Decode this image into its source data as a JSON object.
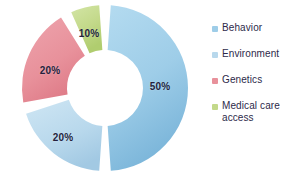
{
  "background": "#ffffff",
  "text_color": "#2d2a4a",
  "label_color": "#241f3d",
  "chart_data": {
    "type": "pie",
    "variant": "donut",
    "title": "",
    "subtitle": "",
    "xlabel": "",
    "ylabel": "",
    "legend_position": "right",
    "grid": false,
    "units": "%",
    "total": 100,
    "categories": [
      "Behavior",
      "Environment",
      "Genetics",
      "Medical care access"
    ],
    "values": [
      50,
      20,
      20,
      10
    ],
    "colors": [
      "#9ecde8",
      "#b8d8ec",
      "#e8919b",
      "#c3d98a"
    ],
    "data_labels": [
      "50%",
      "20%",
      "20%",
      "10%"
    ],
    "slices": [
      {
        "name": "Behavior",
        "value": 50,
        "label": "50%",
        "color": "#9ecde8",
        "color_end": "#7fb9dc",
        "start_angle": 4,
        "end_angle": 176,
        "label_x": 160,
        "label_y": 86
      },
      {
        "name": "Environment",
        "value": 20,
        "label": "20%",
        "color": "#c3dcee",
        "color_end": "#a8cde6",
        "start_angle": 184,
        "end_angle": 252,
        "label_x": 63,
        "label_y": 137
      },
      {
        "name": "Genetics",
        "value": 20,
        "label": "20%",
        "color": "#e8919b",
        "color_end": "#de7b88",
        "start_angle": 260,
        "end_angle": 328,
        "label_x": 50,
        "label_y": 70
      },
      {
        "name": "Medical care access",
        "value": 10,
        "label": "10%",
        "color": "#c9dd91",
        "color_end": "#b4d071",
        "start_angle": 336,
        "end_angle": 356,
        "label_x": 89,
        "label_y": 33
      }
    ],
    "geometry": {
      "center_x": 105,
      "center_y": 88,
      "outer_radius": 83,
      "inner_radius": 38
    }
  },
  "legend": {
    "items": [
      {
        "label": "Behavior",
        "color": "#9ecde8",
        "swatch_icon": "legend-swatch-icon"
      },
      {
        "label": "Environment",
        "color": "#b8d8ec",
        "swatch_icon": "legend-swatch-icon"
      },
      {
        "label": "Genetics",
        "color": "#e8919b",
        "swatch_icon": "legend-swatch-icon"
      },
      {
        "label": "Medical care access",
        "color": "#c3d98a",
        "swatch_icon": "legend-swatch-icon"
      }
    ]
  }
}
